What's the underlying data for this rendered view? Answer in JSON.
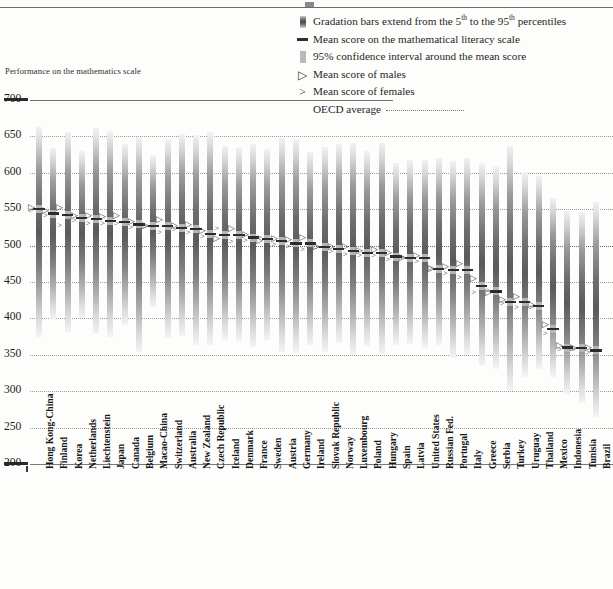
{
  "chart_data": {
    "type": "bar",
    "title": "",
    "ylabel": "Performance on the mathematics scale",
    "xlabel": "",
    "ylim": [
      200,
      700
    ],
    "ytick_step": 50,
    "yticks": [
      700,
      650,
      600,
      550,
      500,
      450,
      400,
      350,
      300,
      250,
      200
    ],
    "grid": true,
    "legend_position": "top-right",
    "oecd_average": 500,
    "categories": [
      "Hong Kong-China",
      "Finland",
      "Korea",
      "Netherlands",
      "Liechtenstein",
      "Japan",
      "Canada",
      "Belgium",
      "Macao-China",
      "Switzerland",
      "Australia",
      "New Zealand",
      "Czech Republic",
      "Iceland",
      "Denmark",
      "France",
      "Sweden",
      "Austria",
      "Germany",
      "Ireland",
      "Slovak Republic",
      "Norway",
      "Luxembourg",
      "Poland",
      "Hungary",
      "Spain",
      "Latvia",
      "United States",
      "Russian Fed.",
      "Portugal",
      "Italy",
      "Greece",
      "Serbia",
      "Turkey",
      "Uruguay",
      "Thailand",
      "Mexico",
      "Indonesia",
      "Tunisia",
      "Brazil"
    ],
    "series": [
      {
        "name": "5th percentile",
        "values": [
          374,
          398,
          382,
          401,
          378,
          375,
          391,
          354,
          415,
          373,
          376,
          363,
          364,
          371,
          369,
          361,
          371,
          354,
          353,
          364,
          354,
          366,
          350,
          362,
          351,
          364,
          365,
          359,
          363,
          346,
          350,
          334,
          331,
          300,
          320,
          331,
          320,
          296,
          284,
          264
        ]
      },
      {
        "name": "95th percentile",
        "values": [
          663,
          634,
          656,
          630,
          661,
          658,
          640,
          649,
          623,
          646,
          653,
          652,
          656,
          637,
          634,
          639,
          633,
          648,
          646,
          628,
          635,
          639,
          641,
          630,
          641,
          613,
          617,
          618,
          621,
          616,
          621,
          613,
          610,
          637,
          601,
          595,
          565,
          548,
          546,
          560
        ]
      },
      {
        "name": "Mean score",
        "values": [
          550,
          544,
          542,
          538,
          536,
          534,
          532,
          529,
          527,
          527,
          524,
          523,
          516,
          515,
          514,
          511,
          509,
          506,
          503,
          503,
          498,
          495,
          493,
          490,
          490,
          485,
          483,
          483,
          468,
          466,
          466,
          445,
          437,
          423,
          422,
          417,
          385,
          360,
          359,
          356
        ]
      },
      {
        "name": "Mean score of males",
        "values": [
          552,
          548,
          552,
          540,
          540,
          539,
          541,
          533,
          527,
          535,
          527,
          528,
          520,
          509,
          523,
          515,
          507,
          509,
          508,
          510,
          498,
          498,
          498,
          493,
          494,
          490,
          483,
          486,
          468,
          471,
          475,
          454,
          435,
          425,
          429,
          419,
          391,
          362,
          359,
          360
        ]
      },
      {
        "name": "Mean score of females",
        "values": [
          548,
          541,
          528,
          535,
          531,
          530,
          530,
          525,
          527,
          518,
          522,
          518,
          512,
          523,
          506,
          507,
          511,
          502,
          499,
          495,
          498,
          492,
          488,
          487,
          486,
          481,
          484,
          478,
          468,
          462,
          457,
          436,
          439,
          421,
          415,
          415,
          380,
          358,
          358,
          353
        ]
      }
    ],
    "series_colors": {
      "gradation_bar": "#4b4b4b",
      "confidence_interval": "#b5b5b5",
      "mean_line": "#2b2b2b"
    }
  },
  "legend": {
    "items": [
      {
        "mark": "gradation-bar-swatch",
        "text_before": "Gradation bars extend from the 5",
        "sup1": "th",
        "text_mid": " to the 95",
        "sup2": "th",
        "text_after": " percentiles"
      },
      {
        "mark": "mean-line-swatch",
        "text": "Mean score on the mathematical literacy scale"
      },
      {
        "mark": "confidence-interval-swatch",
        "text": "95% confidence interval around the mean score"
      },
      {
        "mark": "male-marker-glyph",
        "glyph": "▷",
        "text": "Mean score of males"
      },
      {
        "mark": "female-marker-glyph",
        "glyph": ">",
        "text": "Mean score of females"
      },
      {
        "mark": "oecd-average-line",
        "text": "OECD average"
      }
    ],
    "male_glyph": "▷",
    "female_glyph": ">",
    "l1_a": "Gradation bars extend from the 5",
    "l1_sup1": "th",
    "l1_b": " to the 95",
    "l1_sup2": "th",
    "l1_c": " percentiles",
    "l2": "Mean score on the mathematical literacy scale",
    "l3": "95% confidence interval around the mean score",
    "l4": "Mean score of males",
    "l5": "Mean score of females",
    "l6": "OECD average"
  },
  "axis": {
    "title": "Performance on the mathematics scale"
  }
}
